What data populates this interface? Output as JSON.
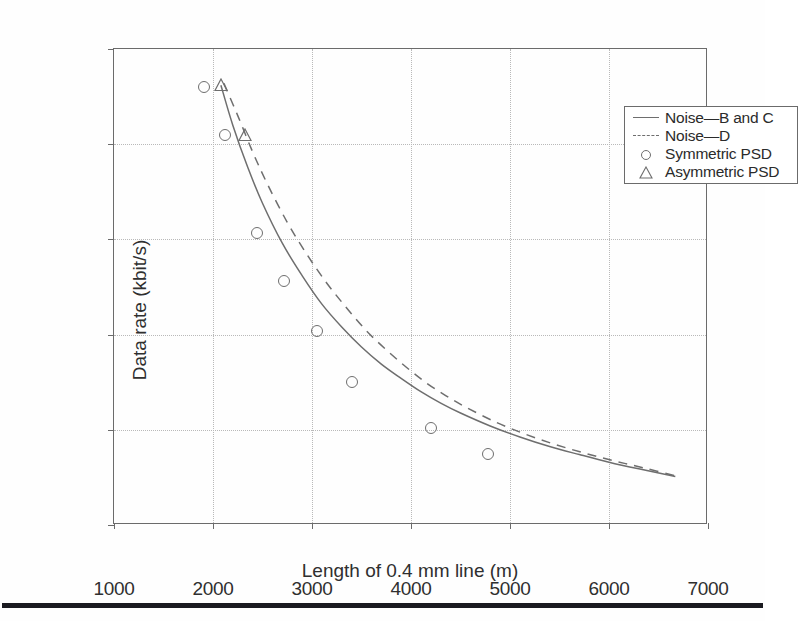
{
  "figure": {
    "background_color": "#fefefe",
    "axis_color": "#6b6b6b",
    "grid_color": "#b9b9b9",
    "series_color": "#6e6e6e",
    "bottom_rule_color": "#1a1a20"
  },
  "axes": {
    "x_title": "Length of 0.4 mm line (m)",
    "y_title": "Data rate (kbit/s)",
    "x_ticks": [
      "1000",
      "2000",
      "3000",
      "4000",
      "5000",
      "6000",
      "7000"
    ],
    "y_ticks": [
      "0",
      "500",
      "1000",
      "1500",
      "2000",
      "2500"
    ]
  },
  "legend": {
    "items": [
      {
        "label": "Noise—B and C",
        "key": "solid-line-key"
      },
      {
        "label": "Noise—D",
        "key": "dashed-line-key"
      },
      {
        "label": "Symmetric PSD",
        "key": "circle-marker-key"
      },
      {
        "label": "Asymmetric PSD",
        "key": "triangle-marker-key"
      }
    ]
  },
  "chart_data": {
    "type": "line",
    "title": "",
    "xlabel": "Length of 0.4 mm line (m)",
    "ylabel": "Data rate (kbit/s)",
    "xlim": [
      1000,
      7000
    ],
    "ylim": [
      0,
      2500
    ],
    "xticks": [
      1000,
      2000,
      3000,
      4000,
      5000,
      6000,
      7000
    ],
    "yticks": [
      0,
      500,
      1000,
      1500,
      2000,
      2500
    ],
    "grid": true,
    "legend_position": "upper right",
    "series": [
      {
        "name": "Noise—B and C",
        "style": "solid",
        "color": "#6e6e6e",
        "x": [
          2080,
          2200,
          2350,
          2500,
          2700,
          2900,
          3100,
          3300,
          3500,
          3700,
          3900,
          4100,
          4300,
          4500,
          4800,
          5100,
          5400,
          5700,
          6000,
          6300,
          6670
        ],
        "y": [
          2310,
          2100,
          1880,
          1690,
          1480,
          1310,
          1160,
          1040,
          935,
          845,
          770,
          700,
          640,
          588,
          520,
          462,
          412,
          370,
          330,
          295,
          255
        ]
      },
      {
        "name": "Noise—D",
        "style": "dashed",
        "color": "#6e6e6e",
        "x": [
          2110,
          2250,
          2400,
          2550,
          2750,
          2950,
          3150,
          3350,
          3550,
          3750,
          3950,
          4150,
          4350,
          4550,
          4850,
          5150,
          5450,
          5750,
          6050,
          6350,
          6670
        ],
        "y": [
          2320,
          2150,
          1960,
          1790,
          1590,
          1420,
          1270,
          1140,
          1020,
          920,
          830,
          748,
          680,
          620,
          542,
          478,
          424,
          378,
          337,
          300,
          258
        ]
      },
      {
        "name": "Symmetric PSD",
        "style": "markers",
        "marker": "circle",
        "color": "#6e6e6e",
        "x": [
          1908,
          2120,
          2440,
          2720,
          3050,
          3400,
          4200,
          4780
        ],
        "y": [
          2302,
          2048,
          1535,
          1280,
          1020,
          750,
          510,
          375
        ]
      },
      {
        "name": "Asymmetric PSD",
        "style": "markers",
        "marker": "triangle",
        "color": "#6e6e6e",
        "x": [
          2080,
          2320
        ],
        "y": [
          2310,
          2050
        ]
      }
    ]
  }
}
